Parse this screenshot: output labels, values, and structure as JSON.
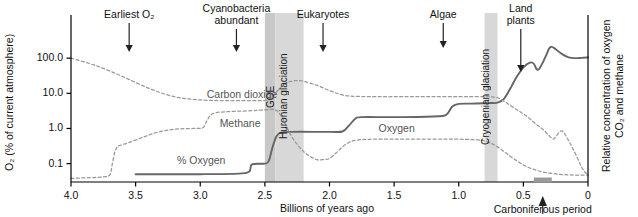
{
  "chart_data": {
    "type": "line",
    "title": "",
    "xlabel": "Billions of years ago",
    "ylabel_left": "O₂ (% of current atmosphere)",
    "ylabel_right": "Relative concentration of oxygen CO₂ and methane",
    "xlim": [
      4.0,
      0.0
    ],
    "x_reversed": true,
    "xticks": [
      "4.0",
      "3.5",
      "3.0",
      "2.5",
      "2.0",
      "1.5",
      "1.0",
      "0.5",
      "0"
    ],
    "xtick_values": [
      4.0,
      3.5,
      3.0,
      2.5,
      2.0,
      1.5,
      1.0,
      0.5,
      0.0
    ],
    "yticks": [
      "100.0",
      "10.0",
      "1.0",
      "0.1"
    ],
    "ytick_values": [
      100.0,
      10.0,
      1.0,
      0.1
    ],
    "y_scale": "log",
    "ylim": [
      0.03,
      400
    ],
    "grid": false,
    "legend": "inline-labels",
    "series": [
      {
        "name": "% Oxygen",
        "label": "% Oxygen",
        "style": "solid",
        "color": "#666666",
        "points": [
          [
            3.5,
            0.05
          ],
          [
            3.0,
            0.05
          ],
          [
            2.7,
            0.052
          ],
          [
            2.62,
            0.06
          ],
          [
            2.6,
            0.095
          ],
          [
            2.5,
            0.1
          ],
          [
            2.47,
            0.12
          ],
          [
            2.44,
            0.3
          ],
          [
            2.41,
            0.6
          ],
          [
            2.38,
            0.75
          ],
          [
            2.3,
            0.8
          ],
          [
            2.0,
            0.8
          ],
          [
            1.9,
            0.82
          ],
          [
            1.85,
            1.2
          ],
          [
            1.8,
            1.9
          ],
          [
            1.75,
            2.1
          ],
          [
            1.5,
            2.1
          ],
          [
            1.2,
            2.2
          ],
          [
            1.1,
            2.4
          ],
          [
            1.05,
            4.2
          ],
          [
            1.0,
            5.0
          ],
          [
            0.9,
            5.1
          ],
          [
            0.8,
            5.2
          ],
          [
            0.75,
            5.3
          ],
          [
            0.7,
            5.4
          ],
          [
            0.65,
            7.0
          ],
          [
            0.6,
            14
          ],
          [
            0.55,
            30
          ],
          [
            0.5,
            55
          ],
          [
            0.45,
            75
          ],
          [
            0.42,
            70
          ],
          [
            0.4,
            50
          ],
          [
            0.38,
            48
          ],
          [
            0.35,
            75
          ],
          [
            0.32,
            130
          ],
          [
            0.3,
            190
          ],
          [
            0.28,
            210
          ],
          [
            0.25,
            180
          ],
          [
            0.2,
            130
          ],
          [
            0.15,
            105
          ],
          [
            0.1,
            100
          ],
          [
            0.05,
            102
          ],
          [
            0.0,
            105
          ]
        ]
      },
      {
        "name": "Carbon dioxide",
        "label": "Carbon dioxide",
        "style": "dashed",
        "color": "#999999",
        "points": [
          [
            4.0,
            100
          ],
          [
            3.8,
            60
          ],
          [
            3.6,
            30
          ],
          [
            3.4,
            14
          ],
          [
            3.2,
            8.0
          ],
          [
            3.0,
            6.5
          ],
          [
            2.8,
            6.2
          ],
          [
            2.6,
            6.2
          ],
          [
            2.5,
            6.3
          ],
          [
            2.45,
            7.5
          ],
          [
            2.4,
            12
          ],
          [
            2.35,
            18
          ],
          [
            2.3,
            22
          ],
          [
            2.25,
            23
          ],
          [
            2.2,
            22
          ],
          [
            2.1,
            17
          ],
          [
            2.0,
            12
          ],
          [
            1.9,
            9.0
          ],
          [
            1.8,
            8.2
          ],
          [
            1.6,
            8.0
          ],
          [
            1.4,
            8.0
          ],
          [
            1.2,
            8.0
          ],
          [
            1.0,
            8.0
          ],
          [
            0.9,
            8.0
          ],
          [
            0.8,
            8.0
          ],
          [
            0.75,
            8.0
          ],
          [
            0.7,
            7.5
          ],
          [
            0.65,
            6.0
          ],
          [
            0.6,
            4.5
          ],
          [
            0.55,
            3.4
          ],
          [
            0.5,
            2.6
          ],
          [
            0.45,
            1.9
          ],
          [
            0.4,
            1.3
          ],
          [
            0.35,
            0.95
          ],
          [
            0.3,
            0.62
          ],
          [
            0.27,
            0.5
          ],
          [
            0.25,
            0.58
          ],
          [
            0.22,
            0.8
          ],
          [
            0.2,
            0.85
          ],
          [
            0.18,
            0.7
          ],
          [
            0.15,
            0.45
          ],
          [
            0.12,
            0.28
          ],
          [
            0.08,
            0.14
          ],
          [
            0.05,
            0.08
          ],
          [
            0.02,
            0.055
          ],
          [
            0.0,
            0.05
          ]
        ]
      },
      {
        "name": "Methane",
        "label": "Methane",
        "style": "dashed",
        "color": "#999999",
        "points": [
          [
            4.0,
            0.038
          ],
          [
            3.85,
            0.04
          ],
          [
            3.75,
            0.042
          ],
          [
            3.7,
            0.048
          ],
          [
            3.68,
            0.1
          ],
          [
            3.66,
            0.22
          ],
          [
            3.64,
            0.3
          ],
          [
            3.62,
            0.33
          ],
          [
            3.55,
            0.4
          ],
          [
            3.45,
            0.55
          ],
          [
            3.35,
            0.75
          ],
          [
            3.25,
            0.9
          ],
          [
            3.15,
            0.98
          ],
          [
            3.05,
            1.0
          ],
          [
            2.98,
            1.05
          ],
          [
            2.95,
            1.6
          ],
          [
            2.92,
            2.4
          ],
          [
            2.88,
            2.8
          ],
          [
            2.8,
            3.0
          ],
          [
            2.7,
            3.1
          ],
          [
            2.6,
            3.2
          ],
          [
            2.55,
            3.3
          ],
          [
            2.5,
            3.4
          ],
          [
            2.45,
            3.5
          ],
          [
            2.42,
            3.4
          ],
          [
            2.4,
            3.0
          ],
          [
            2.37,
            2.2
          ],
          [
            2.34,
            1.3
          ],
          [
            2.3,
            0.65
          ],
          [
            2.25,
            0.35
          ],
          [
            2.2,
            0.22
          ],
          [
            2.15,
            0.16
          ],
          [
            2.1,
            0.13
          ],
          [
            2.05,
            0.13
          ],
          [
            2.0,
            0.14
          ],
          [
            1.95,
            0.2
          ],
          [
            1.9,
            0.3
          ],
          [
            1.85,
            0.4
          ],
          [
            1.8,
            0.46
          ],
          [
            1.7,
            0.49
          ],
          [
            1.5,
            0.5
          ],
          [
            1.3,
            0.5
          ],
          [
            1.1,
            0.5
          ],
          [
            0.95,
            0.49
          ],
          [
            0.85,
            0.47
          ],
          [
            0.8,
            0.44
          ],
          [
            0.75,
            0.38
          ],
          [
            0.7,
            0.3
          ],
          [
            0.65,
            0.22
          ],
          [
            0.6,
            0.16
          ],
          [
            0.55,
            0.12
          ],
          [
            0.5,
            0.092
          ],
          [
            0.45,
            0.075
          ],
          [
            0.4,
            0.065
          ],
          [
            0.35,
            0.058
          ],
          [
            0.3,
            0.054
          ],
          [
            0.25,
            0.051
          ],
          [
            0.2,
            0.049
          ],
          [
            0.15,
            0.048
          ],
          [
            0.1,
            0.047
          ],
          [
            0.05,
            0.047
          ],
          [
            0.0,
            0.047
          ]
        ]
      }
    ],
    "bands": [
      {
        "name": "GOE",
        "label": "GOE",
        "x_start": 2.5,
        "x_end": 2.42,
        "color": "#c8c8c8"
      },
      {
        "name": "Huronian glaciation",
        "label": "Huronian glaciation",
        "x_start": 2.42,
        "x_end": 2.2,
        "color": "#d8d8d8"
      },
      {
        "name": "Cryogenian glaciation",
        "label": "Cryogenian glaciation",
        "x_start": 0.8,
        "x_end": 0.7,
        "color": "#d8d8d8"
      }
    ],
    "annotations": [
      {
        "name": "earliest-oxygen",
        "label": "Earliest O₂",
        "x": 3.55,
        "lines": [
          "Earliest O₂"
        ]
      },
      {
        "name": "cyanobacteria-abundant",
        "label": "Cyanobacteria abundant",
        "x": 2.72,
        "lines": [
          "Cyanobacteria",
          "abundant"
        ]
      },
      {
        "name": "eukaryotes",
        "label": "Eukaryotes",
        "x": 2.05,
        "lines": [
          "Eukaryotes"
        ]
      },
      {
        "name": "algae",
        "label": "Algae",
        "x": 1.12,
        "lines": [
          "Algae"
        ]
      },
      {
        "name": "land-plants",
        "label": "Land plants",
        "x": 0.52,
        "lines": [
          "Land",
          "plants"
        ]
      }
    ],
    "bottom_annotation": {
      "name": "carboniferous-period",
      "label": "Carboniferous period",
      "x": 0.35,
      "marker": "gray-bar"
    },
    "inline_labels": [
      {
        "name": "carbon-dioxide-label",
        "text": "Carbon dioxide",
        "x": 2.95,
        "y": 9.0
      },
      {
        "name": "methane-label",
        "text": "Methane",
        "x": 2.85,
        "y": 1.35
      },
      {
        "name": "percent-oxygen-label",
        "text": "% Oxygen",
        "x": 3.18,
        "y": 0.115
      },
      {
        "name": "oxygen-label",
        "text": "Oxygen",
        "x": 1.62,
        "y": 0.95
      }
    ]
  }
}
